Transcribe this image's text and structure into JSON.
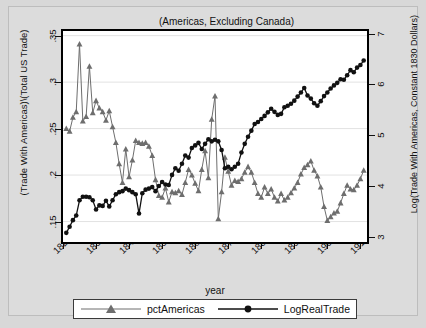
{
  "figure": {
    "annotation": "(Americas, Excluding Canada)",
    "background_color": "#d8d8d8",
    "plot_background_color": "#ffffff",
    "frame_color": "#000000"
  },
  "legend": {
    "entries": [
      {
        "label": "pctAmericas",
        "marker": "triangle-marker",
        "color": "#6e6e6e"
      },
      {
        "label": "LogRealTrade",
        "marker": "circle-marker",
        "color": "#111111"
      }
    ]
  },
  "chart_data": {
    "type": "line",
    "title": "",
    "subtitle": "(Americas, Excluding Canada)",
    "xlabel": "year",
    "ylabel": "(Trade With Americas)\\(Total US Trade)",
    "y2label": "Log(Trade With Americas, Constant 1830 Dollars)",
    "xlim": [
      1820,
      1912
    ],
    "ylim": [
      0.128,
      0.355
    ],
    "y2lim": [
      2.9,
      7.05
    ],
    "grid": true,
    "grid_axis": "y",
    "legend_position": "bottom",
    "xticks": [
      1820,
      1830,
      1840,
      1850,
      1860,
      1870,
      1880,
      1890,
      1900,
      1910
    ],
    "xticklabels": [
      "1820",
      "1830",
      "1840",
      "1850",
      "1860",
      "1870",
      "1880",
      "1890",
      "1900",
      "1910"
    ],
    "yticks": [
      0.15,
      0.2,
      0.25,
      0.3,
      0.35
    ],
    "yticklabels": [
      ".15",
      ".2",
      ".25",
      ".3",
      ".35"
    ],
    "y2ticks": [
      3,
      4,
      5,
      6,
      7
    ],
    "y2ticklabels": [
      "3",
      "4",
      "5",
      "6",
      "7"
    ],
    "series": [
      {
        "name": "pctAmericas",
        "axis": "left",
        "color": "#6e6e6e",
        "marker": "triangle",
        "x": [
          1821,
          1822,
          1823,
          1824,
          1825,
          1826,
          1827,
          1828,
          1829,
          1830,
          1831,
          1832,
          1833,
          1834,
          1835,
          1836,
          1837,
          1838,
          1839,
          1840,
          1841,
          1842,
          1843,
          1844,
          1845,
          1846,
          1847,
          1848,
          1849,
          1850,
          1851,
          1852,
          1853,
          1854,
          1855,
          1856,
          1857,
          1858,
          1859,
          1860,
          1861,
          1862,
          1863,
          1864,
          1865,
          1866,
          1867,
          1868,
          1869,
          1870,
          1871,
          1872,
          1873,
          1874,
          1875,
          1876,
          1877,
          1878,
          1879,
          1880,
          1881,
          1882,
          1883,
          1884,
          1885,
          1886,
          1887,
          1888,
          1889,
          1890,
          1891,
          1892,
          1893,
          1894,
          1895,
          1896,
          1897,
          1898,
          1899,
          1900,
          1901,
          1902,
          1903,
          1904,
          1905,
          1906,
          1907,
          1908,
          1909,
          1910,
          1911
        ],
        "values": [
          0.25,
          0.247,
          0.262,
          0.268,
          0.341,
          0.258,
          0.263,
          0.317,
          0.267,
          0.28,
          0.272,
          0.268,
          0.259,
          0.269,
          0.252,
          0.235,
          0.212,
          0.192,
          0.228,
          0.198,
          0.216,
          0.237,
          0.235,
          0.234,
          0.235,
          0.231,
          0.221,
          0.195,
          0.178,
          0.176,
          0.186,
          0.171,
          0.182,
          0.181,
          0.183,
          0.179,
          0.192,
          0.206,
          0.2,
          0.191,
          0.183,
          0.206,
          0.226,
          0.197,
          0.26,
          0.285,
          0.153,
          0.182,
          0.219,
          0.204,
          0.189,
          0.194,
          0.193,
          0.196,
          0.203,
          0.209,
          0.203,
          0.192,
          0.18,
          0.176,
          0.187,
          0.18,
          0.185,
          0.176,
          0.172,
          0.18,
          0.173,
          0.176,
          0.181,
          0.186,
          0.192,
          0.201,
          0.208,
          0.211,
          0.215,
          0.205,
          0.199,
          0.187,
          0.166,
          0.151,
          0.155,
          0.159,
          0.161,
          0.17,
          0.18,
          0.189,
          0.185,
          0.184,
          0.189,
          0.196,
          0.205
        ]
      },
      {
        "name": "LogRealTrade",
        "axis": "right",
        "color": "#111111",
        "marker": "circle",
        "x": [
          1821,
          1822,
          1823,
          1824,
          1825,
          1826,
          1827,
          1828,
          1829,
          1830,
          1831,
          1832,
          1833,
          1834,
          1835,
          1836,
          1837,
          1838,
          1839,
          1840,
          1841,
          1842,
          1843,
          1844,
          1845,
          1846,
          1847,
          1848,
          1849,
          1850,
          1851,
          1852,
          1853,
          1854,
          1855,
          1856,
          1857,
          1858,
          1859,
          1860,
          1861,
          1862,
          1863,
          1864,
          1865,
          1866,
          1867,
          1868,
          1869,
          1870,
          1871,
          1872,
          1873,
          1874,
          1875,
          1876,
          1877,
          1878,
          1879,
          1880,
          1881,
          1882,
          1883,
          1884,
          1885,
          1886,
          1887,
          1888,
          1889,
          1890,
          1891,
          1892,
          1893,
          1894,
          1895,
          1896,
          1897,
          1898,
          1899,
          1900,
          1901,
          1902,
          1903,
          1904,
          1905,
          1906,
          1907,
          1908,
          1909,
          1910,
          1911
        ],
        "values": [
          3.08,
          3.2,
          3.33,
          3.42,
          3.72,
          3.79,
          3.79,
          3.78,
          3.72,
          3.54,
          3.62,
          3.61,
          3.71,
          3.6,
          3.72,
          3.84,
          3.88,
          3.9,
          3.95,
          3.92,
          3.88,
          3.84,
          3.46,
          3.86,
          3.93,
          3.95,
          3.98,
          3.9,
          4.0,
          4.08,
          4.03,
          4.02,
          4.22,
          4.35,
          4.3,
          4.44,
          4.6,
          4.56,
          4.75,
          4.8,
          4.85,
          4.73,
          4.83,
          4.92,
          4.88,
          4.91,
          4.88,
          4.71,
          4.35,
          4.38,
          4.33,
          4.38,
          4.44,
          4.66,
          4.83,
          4.97,
          5.09,
          5.22,
          5.26,
          5.32,
          5.38,
          5.45,
          5.52,
          5.46,
          5.4,
          5.42,
          5.55,
          5.58,
          5.62,
          5.68,
          5.76,
          5.84,
          5.93,
          5.78,
          5.72,
          5.63,
          5.58,
          5.67,
          5.77,
          5.84,
          5.92,
          5.98,
          6.03,
          6.1,
          6.09,
          6.18,
          6.28,
          6.24,
          6.33,
          6.38,
          6.47
        ]
      }
    ]
  }
}
